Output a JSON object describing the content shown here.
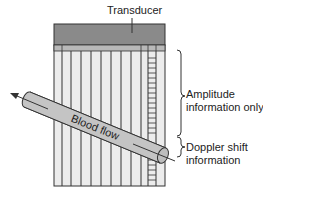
{
  "diagram": {
    "labels": {
      "transducer": "Transducer",
      "amplitude_line1": "Amplitude",
      "amplitude_line2": "information only",
      "doppler_line1": "Doppler shift",
      "doppler_line2": "information",
      "blood_flow": "Blood flow"
    },
    "colors": {
      "transducer": "#8a8a8a",
      "transducer_strip": "#b8b8b8",
      "field": "#ececec",
      "lines": "#333333",
      "vessel": "#c4c4c4"
    }
  }
}
